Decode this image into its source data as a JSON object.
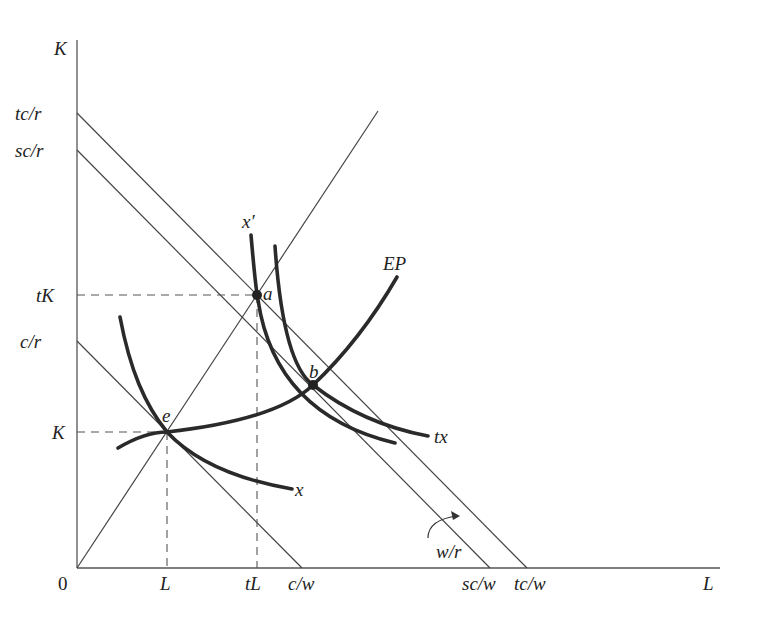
{
  "diagram": {
    "axes": {
      "y_label": "K",
      "x_label": "L",
      "origin_label": "0"
    },
    "y_ticks": [
      "tc/r",
      "sc/r",
      "tK",
      "c/r",
      "K"
    ],
    "x_ticks": [
      "L",
      "tL",
      "c/w",
      "sc/w",
      "tc/w"
    ],
    "curves": {
      "x": "x",
      "x_prime": "x′",
      "tx": "tx",
      "ep": "EP"
    },
    "points": {
      "e": "e",
      "a": "a",
      "b": "b"
    },
    "slope_label": "w/r"
  }
}
